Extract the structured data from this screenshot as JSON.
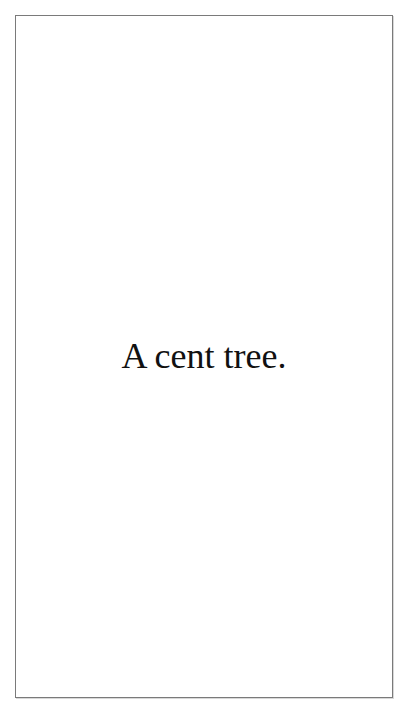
{
  "page": {
    "text": "A cent tree."
  },
  "colors": {
    "background": "#ffffff",
    "border": "#7a7a7a",
    "text": "#111111"
  }
}
